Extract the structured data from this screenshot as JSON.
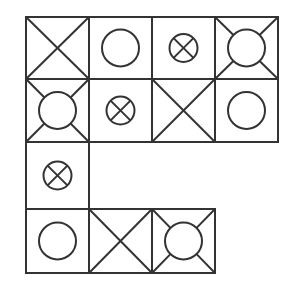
{
  "puzzle": {
    "stroke_color": "#333333",
    "background": "#ffffff",
    "grid": {
      "origin_x": 26,
      "cols_x": [
        26,
        89,
        152,
        215,
        278
      ],
      "rows_y": [
        17,
        79,
        142,
        209,
        273
      ]
    },
    "symbol_legend": {
      "x": "square divided by both diagonals",
      "circle": "plain circle",
      "crossed-circle": "small circle with an X inside",
      "circle-corners": "circle with diagonal lines from corners to circle edge"
    },
    "cells": [
      {
        "row": 0,
        "col": 0,
        "symbol": "x"
      },
      {
        "row": 0,
        "col": 1,
        "symbol": "circle"
      },
      {
        "row": 0,
        "col": 2,
        "symbol": "crossed-circle"
      },
      {
        "row": 0,
        "col": 3,
        "symbol": "circle-corners"
      },
      {
        "row": 1,
        "col": 0,
        "symbol": "circle-corners"
      },
      {
        "row": 1,
        "col": 1,
        "symbol": "crossed-circle"
      },
      {
        "row": 1,
        "col": 2,
        "symbol": "x"
      },
      {
        "row": 1,
        "col": 3,
        "symbol": "circle"
      },
      {
        "row": 2,
        "col": 0,
        "symbol": "crossed-circle"
      },
      {
        "row": 3,
        "col": 0,
        "symbol": "circle"
      },
      {
        "row": 3,
        "col": 1,
        "symbol": "x"
      },
      {
        "row": 3,
        "col": 2,
        "symbol": "circle-corners"
      }
    ]
  }
}
